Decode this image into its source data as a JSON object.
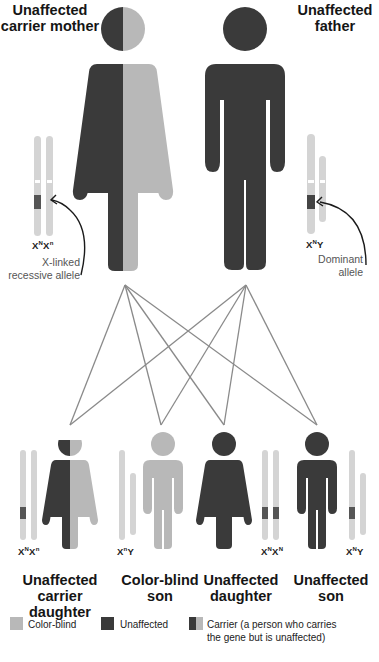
{
  "parents": {
    "mother": {
      "title_line1": "Unaffected",
      "title_line2": "carrier mother",
      "genotype": "XNXn",
      "g1": "X",
      "s1": "N",
      "g2": "X",
      "s2": "n",
      "status": "carrier"
    },
    "father": {
      "title_line1": "Unaffected",
      "title_line2": "father",
      "genotype": "XNY",
      "g1": "X",
      "s1": "N",
      "g2": "Y",
      "s2": "",
      "status": "unaffected"
    }
  },
  "annotations": {
    "recessive_line1": "X-linked",
    "recessive_line2": "recessive allele",
    "dominant_line1": "Dominant",
    "dominant_line2": "allele"
  },
  "children": [
    {
      "title_line1": "Unaffected",
      "title_line2": "carrier daughter",
      "g1": "X",
      "s1": "N",
      "g2": "X",
      "s2": "n",
      "status": "carrier",
      "sex": "female"
    },
    {
      "title_line1": "Color-blind",
      "title_line2": "son",
      "g1": "X",
      "s1": "n",
      "g2": "Y",
      "s2": "",
      "status": "color-blind",
      "sex": "male"
    },
    {
      "title_line1": "Unaffected",
      "title_line2": "daughter",
      "g1": "X",
      "s1": "N",
      "g2": "X",
      "s2": "N",
      "status": "unaffected",
      "sex": "female"
    },
    {
      "title_line1": "Unaffected",
      "title_line2": "son",
      "g1": "X",
      "s1": "N",
      "g2": "Y",
      "s2": "",
      "status": "unaffected",
      "sex": "male"
    }
  ],
  "legend": {
    "colorblind": "Color-blind",
    "unaffected": "Unaffected",
    "carrier_line1": "Carrier (a person who carries",
    "carrier_line2": "the gene but is unaffected)"
  },
  "colors": {
    "dark": "#3a3a3a",
    "light": "#b8b8b8",
    "chromosome": "#d4d4d4",
    "allele_band": "#555555",
    "lines": "#8a8a8a"
  }
}
